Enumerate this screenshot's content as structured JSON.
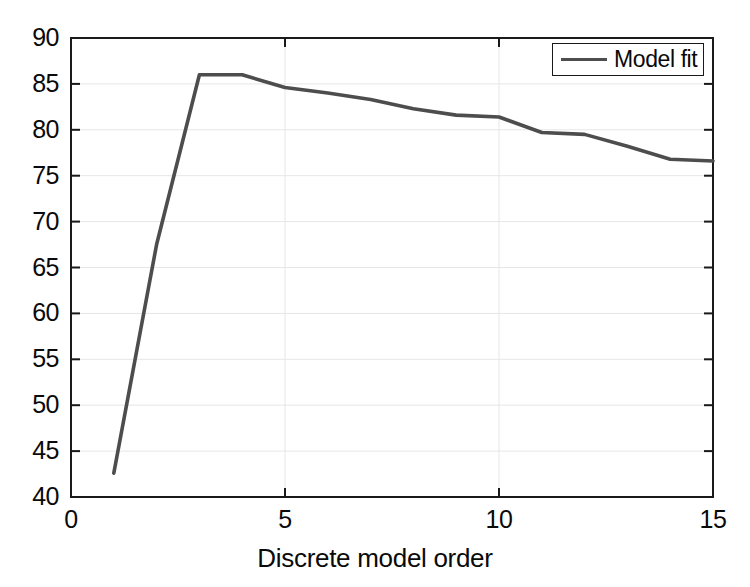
{
  "chart_data": {
    "type": "line",
    "title": "",
    "xlabel": "Discrete model order",
    "ylabel": "",
    "xlim": [
      0,
      15
    ],
    "ylim": [
      40,
      90
    ],
    "grid": true,
    "legend_position": "top-right",
    "x": [
      1,
      2,
      3,
      4,
      5,
      6,
      7,
      8,
      9,
      10,
      11,
      12,
      13,
      14,
      15
    ],
    "series": [
      {
        "name": "Model fit",
        "color": "#4d4d4d",
        "values": [
          42.6,
          67.5,
          86.0,
          86.0,
          84.6,
          84.0,
          83.3,
          82.3,
          81.6,
          81.4,
          79.7,
          79.5,
          78.2,
          76.8,
          76.6
        ]
      }
    ],
    "xticks": [
      0,
      5,
      10,
      15
    ],
    "xtick_labels": [
      "0",
      "5",
      "10",
      "15"
    ],
    "yticks": [
      40,
      45,
      50,
      55,
      60,
      65,
      70,
      75,
      80,
      85,
      90
    ],
    "ytick_labels": [
      "40",
      "45",
      "50",
      "55",
      "60",
      "65",
      "70",
      "75",
      "80",
      "85",
      "90"
    ]
  },
  "legend": {
    "entries": [
      {
        "label": "Model fit"
      }
    ]
  },
  "axes": {
    "frame_color": "#1a1a1a",
    "grid_color": "#e6e6e6",
    "tick_color": "#1a1a1a",
    "background": "#ffffff"
  }
}
